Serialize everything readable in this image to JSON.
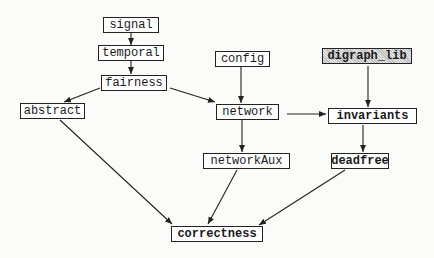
{
  "diagram": {
    "type": "module dependency graph",
    "nodes": [
      {
        "id": "signal",
        "label": "signal",
        "style": "plain"
      },
      {
        "id": "temporal",
        "label": "temporal",
        "style": "plain"
      },
      {
        "id": "fairness",
        "label": "fairness",
        "style": "plain"
      },
      {
        "id": "abstract",
        "label": "abstract",
        "style": "plain"
      },
      {
        "id": "config",
        "label": "config",
        "style": "plain"
      },
      {
        "id": "network",
        "label": "network",
        "style": "plain"
      },
      {
        "id": "digraph_lib",
        "label": "digraph_lib",
        "style": "shaded"
      },
      {
        "id": "invariants",
        "label": "invariants",
        "style": "bold"
      },
      {
        "id": "networkAux",
        "label": "networkAux",
        "style": "plain"
      },
      {
        "id": "deadfree",
        "label": "deadfree",
        "style": "bold"
      },
      {
        "id": "correctness",
        "label": "correctness",
        "style": "bold"
      }
    ],
    "edges": [
      {
        "from": "signal",
        "to": "temporal"
      },
      {
        "from": "temporal",
        "to": "fairness"
      },
      {
        "from": "fairness",
        "to": "abstract"
      },
      {
        "from": "fairness",
        "to": "network"
      },
      {
        "from": "config",
        "to": "network"
      },
      {
        "from": "network",
        "to": "invariants"
      },
      {
        "from": "digraph_lib",
        "to": "invariants"
      },
      {
        "from": "network",
        "to": "networkAux"
      },
      {
        "from": "invariants",
        "to": "deadfree"
      },
      {
        "from": "abstract",
        "to": "correctness"
      },
      {
        "from": "networkAux",
        "to": "correctness"
      },
      {
        "from": "deadfree",
        "to": "correctness"
      }
    ]
  }
}
